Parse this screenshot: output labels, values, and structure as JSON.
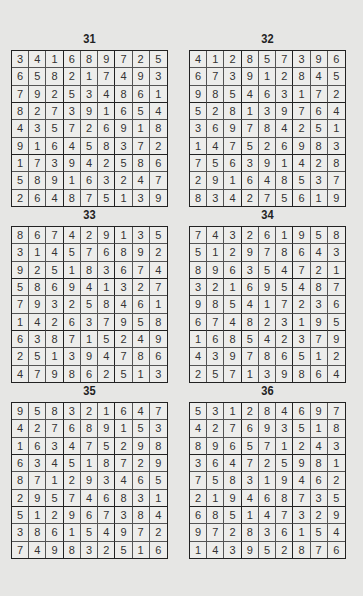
{
  "puzzles": [
    {
      "number": "31",
      "grid": [
        [
          3,
          4,
          1,
          6,
          8,
          9,
          7,
          2,
          5
        ],
        [
          6,
          5,
          8,
          2,
          1,
          7,
          4,
          9,
          3
        ],
        [
          7,
          9,
          2,
          5,
          3,
          4,
          8,
          6,
          1
        ],
        [
          8,
          2,
          7,
          3,
          9,
          1,
          6,
          5,
          4
        ],
        [
          4,
          3,
          5,
          7,
          2,
          6,
          9,
          1,
          8
        ],
        [
          9,
          1,
          6,
          4,
          5,
          8,
          3,
          7,
          2
        ],
        [
          1,
          7,
          3,
          9,
          4,
          2,
          5,
          8,
          6
        ],
        [
          5,
          8,
          9,
          1,
          6,
          3,
          2,
          4,
          7
        ],
        [
          2,
          6,
          4,
          8,
          7,
          5,
          1,
          3,
          9
        ]
      ]
    },
    {
      "number": "32",
      "grid": [
        [
          4,
          1,
          2,
          8,
          5,
          7,
          3,
          9,
          6
        ],
        [
          6,
          7,
          3,
          9,
          1,
          2,
          8,
          4,
          5
        ],
        [
          9,
          8,
          5,
          4,
          6,
          3,
          1,
          7,
          2
        ],
        [
          5,
          2,
          8,
          1,
          3,
          9,
          7,
          6,
          4
        ],
        [
          3,
          6,
          9,
          7,
          8,
          4,
          2,
          5,
          1
        ],
        [
          1,
          4,
          7,
          5,
          2,
          6,
          9,
          8,
          3
        ],
        [
          7,
          5,
          6,
          3,
          9,
          1,
          4,
          2,
          8
        ],
        [
          2,
          9,
          1,
          6,
          4,
          8,
          5,
          3,
          7
        ],
        [
          8,
          3,
          4,
          2,
          7,
          5,
          6,
          1,
          9
        ]
      ]
    },
    {
      "number": "33",
      "grid": [
        [
          8,
          6,
          7,
          4,
          2,
          9,
          1,
          3,
          5
        ],
        [
          3,
          1,
          4,
          5,
          7,
          6,
          8,
          9,
          2
        ],
        [
          9,
          2,
          5,
          1,
          8,
          3,
          6,
          7,
          4
        ],
        [
          5,
          8,
          6,
          9,
          4,
          1,
          3,
          2,
          7
        ],
        [
          7,
          9,
          3,
          2,
          5,
          8,
          4,
          6,
          1
        ],
        [
          1,
          4,
          2,
          6,
          3,
          7,
          9,
          5,
          8
        ],
        [
          6,
          3,
          8,
          7,
          1,
          5,
          2,
          4,
          9
        ],
        [
          2,
          5,
          1,
          3,
          9,
          4,
          7,
          8,
          6
        ],
        [
          4,
          7,
          9,
          8,
          6,
          2,
          5,
          1,
          3
        ]
      ]
    },
    {
      "number": "34",
      "grid": [
        [
          7,
          4,
          3,
          2,
          6,
          1,
          9,
          5,
          8
        ],
        [
          5,
          1,
          2,
          9,
          7,
          8,
          6,
          4,
          3
        ],
        [
          8,
          9,
          6,
          3,
          5,
          4,
          7,
          2,
          1
        ],
        [
          3,
          2,
          1,
          6,
          9,
          5,
          4,
          8,
          7
        ],
        [
          9,
          8,
          5,
          4,
          1,
          7,
          2,
          3,
          6
        ],
        [
          6,
          7,
          4,
          8,
          2,
          3,
          1,
          9,
          5
        ],
        [
          1,
          6,
          8,
          5,
          4,
          2,
          3,
          7,
          9
        ],
        [
          4,
          3,
          9,
          7,
          8,
          6,
          5,
          1,
          2
        ],
        [
          2,
          5,
          7,
          1,
          3,
          9,
          8,
          6,
          4
        ]
      ]
    },
    {
      "number": "35",
      "grid": [
        [
          9,
          5,
          8,
          3,
          2,
          1,
          6,
          4,
          7
        ],
        [
          4,
          2,
          7,
          6,
          8,
          9,
          1,
          5,
          3
        ],
        [
          1,
          6,
          3,
          4,
          7,
          5,
          2,
          9,
          8
        ],
        [
          6,
          3,
          4,
          5,
          1,
          8,
          7,
          2,
          9
        ],
        [
          8,
          7,
          1,
          2,
          9,
          3,
          4,
          6,
          5
        ],
        [
          2,
          9,
          5,
          7,
          4,
          6,
          8,
          3,
          1
        ],
        [
          5,
          1,
          2,
          9,
          6,
          7,
          3,
          8,
          4
        ],
        [
          3,
          8,
          6,
          1,
          5,
          4,
          9,
          7,
          2
        ],
        [
          7,
          4,
          9,
          8,
          3,
          2,
          5,
          1,
          6
        ]
      ]
    },
    {
      "number": "36",
      "grid": [
        [
          5,
          3,
          1,
          2,
          8,
          4,
          6,
          9,
          7
        ],
        [
          4,
          2,
          7,
          6,
          9,
          3,
          5,
          1,
          8
        ],
        [
          8,
          9,
          6,
          5,
          7,
          1,
          2,
          4,
          3
        ],
        [
          3,
          6,
          4,
          7,
          2,
          5,
          9,
          8,
          1
        ],
        [
          7,
          5,
          8,
          3,
          1,
          9,
          4,
          6,
          2
        ],
        [
          2,
          1,
          9,
          4,
          6,
          8,
          7,
          3,
          5
        ],
        [
          6,
          8,
          5,
          1,
          4,
          7,
          3,
          2,
          9
        ],
        [
          9,
          7,
          2,
          8,
          3,
          6,
          1,
          5,
          4
        ],
        [
          1,
          4,
          3,
          9,
          5,
          2,
          8,
          7,
          6
        ]
      ]
    }
  ]
}
